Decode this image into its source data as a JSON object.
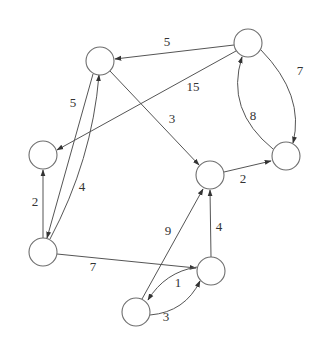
{
  "diagram": {
    "type": "directed-weighted-graph",
    "node_radius": 14,
    "colors": {
      "node_stroke": "#6e6e6e",
      "edge": "#555555",
      "label": "#333333",
      "background": "#ffffff"
    },
    "nodes": [
      {
        "id": "A",
        "x": 100,
        "y": 61
      },
      {
        "id": "B",
        "x": 248,
        "y": 43
      },
      {
        "id": "C",
        "x": 43,
        "y": 155
      },
      {
        "id": "D",
        "x": 286,
        "y": 156
      },
      {
        "id": "E",
        "x": 210,
        "y": 175
      },
      {
        "id": "F",
        "x": 43,
        "y": 252
      },
      {
        "id": "G",
        "x": 211,
        "y": 271
      },
      {
        "id": "H",
        "x": 136,
        "y": 312
      }
    ],
    "edges": [
      {
        "from": "B",
        "to": "A",
        "weight": "5",
        "label_x": 167,
        "label_y": 43
      },
      {
        "from": "B",
        "to": "C",
        "weight": "15",
        "label_x": 193,
        "label_y": 88
      },
      {
        "from": "B",
        "to": "D",
        "weight": "7",
        "label_x": 300,
        "label_y": 72
      },
      {
        "from": "D",
        "to": "B",
        "weight": "8",
        "label_x": 253,
        "label_y": 117
      },
      {
        "from": "A",
        "to": "E",
        "weight": "3",
        "label_x": 172,
        "label_y": 120
      },
      {
        "from": "A",
        "to": "F",
        "weight": "5",
        "label_x": 73,
        "label_y": 104
      },
      {
        "from": "F",
        "to": "A",
        "weight": "4",
        "label_x": 82,
        "label_y": 188
      },
      {
        "from": "F",
        "to": "C",
        "weight": "2",
        "label_x": 35,
        "label_y": 203
      },
      {
        "from": "E",
        "to": "D",
        "weight": "2",
        "label_x": 243,
        "label_y": 180
      },
      {
        "from": "F",
        "to": "G",
        "weight": "7",
        "label_x": 93,
        "label_y": 268
      },
      {
        "from": "G",
        "to": "E",
        "weight": "4",
        "label_x": 219,
        "label_y": 228
      },
      {
        "from": "H",
        "to": "E",
        "weight": "9",
        "label_x": 168,
        "label_y": 232
      },
      {
        "from": "G",
        "to": "H",
        "weight": "1",
        "label_x": 178,
        "label_y": 284
      },
      {
        "from": "H",
        "to": "G",
        "weight": "3",
        "label_x": 166,
        "label_y": 318
      }
    ]
  }
}
